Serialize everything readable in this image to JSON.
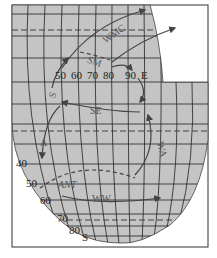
{
  "figure": {
    "caption_cropped": "",
    "colors": {
      "ocean": "#c4c4c4",
      "land_bg": "#ffffff",
      "grid": "#222222",
      "arrow": "#444444",
      "frame": "#333333"
    }
  },
  "longitude_labels": [
    "50",
    "60",
    "70",
    "80",
    "90",
    "E"
  ],
  "latitude_labels": [
    "40",
    "50",
    "60",
    "70",
    "80",
    "S"
  ],
  "currents": [
    {
      "id": "wmc",
      "label": "WMC"
    },
    {
      "id": "sm",
      "label": "SM"
    },
    {
      "id": "s",
      "label": "S"
    },
    {
      "id": "se",
      "label": "SE"
    },
    {
      "id": "a",
      "label": "A"
    },
    {
      "id": "wa",
      "label": "WA"
    },
    {
      "id": "ant",
      "label": "ANT"
    },
    {
      "id": "ww",
      "label": "WW"
    }
  ]
}
